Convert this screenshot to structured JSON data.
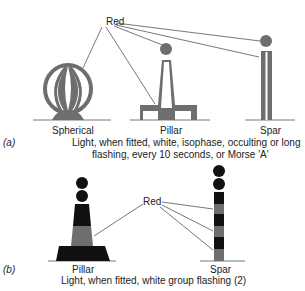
{
  "section_a": {
    "marker": "(a)",
    "callout_label": "Red",
    "shapes": [
      {
        "label": "Spherical"
      },
      {
        "label": "Pillar"
      },
      {
        "label": "Spar"
      }
    ],
    "caption_line1": "Light, when fitted, white, isophase, occulting or long",
    "caption_line2": "flashing, every 10 seconds, or Morse 'A'"
  },
  "section_b": {
    "marker": "(b)",
    "callout_label": "Red",
    "shapes": [
      {
        "label": "Pillar"
      },
      {
        "label": "Spar"
      }
    ],
    "caption": "Light, when fitted, white group flashing (2)"
  },
  "colors": {
    "red_fill": "#6e6e6e",
    "black_fill": "#111111",
    "line": "#444444",
    "background": "#ffffff"
  }
}
